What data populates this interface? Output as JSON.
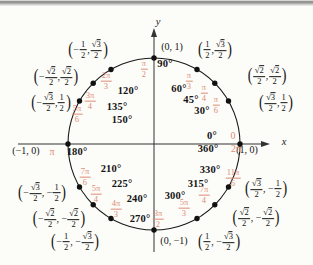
{
  "figure": {
    "type": "unit-circle-diagram",
    "axes": {
      "x_label": "x",
      "y_label": "y"
    },
    "colors": {
      "radian_labels": "#dd8c75",
      "degree_labels": "#141414",
      "coordinate_labels": "#141414",
      "circle": "#1a1a1a",
      "axis": "#333333",
      "top_rule": "#8d8d8b"
    }
  },
  "points": [
    {
      "id": "0",
      "angle_deg": 0,
      "degree_label": "0°",
      "radian": [
        {
          "t": "txt",
          "v": "0"
        }
      ],
      "coordinate": [
        {
          "t": "txt",
          "v": "(1, 0)"
        }
      ]
    },
    {
      "id": "30",
      "angle_deg": 30,
      "degree_label": "30°",
      "radian": [
        {
          "t": "frac",
          "num": "π",
          "den": "6"
        }
      ],
      "coordinate": [
        {
          "t": "par",
          "v": "("
        },
        {
          "t": "frac",
          "num": "√3",
          "den": "2"
        },
        {
          "t": "txt",
          "v": ", "
        },
        {
          "t": "frac",
          "num": "1",
          "den": "2"
        },
        {
          "t": "par",
          "v": ")"
        }
      ]
    },
    {
      "id": "45",
      "angle_deg": 45,
      "degree_label": "45°",
      "radian": [
        {
          "t": "frac",
          "num": "π",
          "den": "4"
        }
      ],
      "coordinate": [
        {
          "t": "par",
          "v": "("
        },
        {
          "t": "frac",
          "num": "√2",
          "den": "2"
        },
        {
          "t": "txt",
          "v": ", "
        },
        {
          "t": "frac",
          "num": "√2",
          "den": "2"
        },
        {
          "t": "par",
          "v": ")"
        }
      ]
    },
    {
      "id": "60",
      "angle_deg": 60,
      "degree_label": "60°",
      "radian": [
        {
          "t": "frac",
          "num": "π",
          "den": "3"
        }
      ],
      "coordinate": [
        {
          "t": "par",
          "v": "("
        },
        {
          "t": "frac",
          "num": "1",
          "den": "2"
        },
        {
          "t": "txt",
          "v": ", "
        },
        {
          "t": "frac",
          "num": "√3",
          "den": "2"
        },
        {
          "t": "par",
          "v": ")"
        }
      ]
    },
    {
      "id": "90",
      "angle_deg": 90,
      "degree_label": "90°",
      "radian": [
        {
          "t": "frac",
          "num": "π",
          "den": "2"
        }
      ],
      "coordinate": [
        {
          "t": "txt",
          "v": "(0, 1)"
        }
      ]
    },
    {
      "id": "120",
      "angle_deg": 120,
      "degree_label": "120°",
      "radian": [
        {
          "t": "frac",
          "num": "2π",
          "den": "3"
        }
      ],
      "coordinate": [
        {
          "t": "par",
          "v": "("
        },
        {
          "t": "txt",
          "v": "−"
        },
        {
          "t": "frac",
          "num": "1",
          "den": "2"
        },
        {
          "t": "txt",
          "v": ", "
        },
        {
          "t": "frac",
          "num": "√3",
          "den": "2"
        },
        {
          "t": "par",
          "v": ")"
        }
      ]
    },
    {
      "id": "135",
      "angle_deg": 135,
      "degree_label": "135°",
      "radian": [
        {
          "t": "frac",
          "num": "3π",
          "den": "4"
        }
      ],
      "coordinate": [
        {
          "t": "par",
          "v": "("
        },
        {
          "t": "txt",
          "v": "−"
        },
        {
          "t": "frac",
          "num": "√2",
          "den": "2"
        },
        {
          "t": "txt",
          "v": ", "
        },
        {
          "t": "frac",
          "num": "√2",
          "den": "2"
        },
        {
          "t": "par",
          "v": ")"
        }
      ]
    },
    {
      "id": "150",
      "angle_deg": 150,
      "degree_label": "150°",
      "radian": [
        {
          "t": "frac",
          "num": "5π",
          "den": "6"
        }
      ],
      "coordinate": [
        {
          "t": "par",
          "v": "("
        },
        {
          "t": "txt",
          "v": "−"
        },
        {
          "t": "frac",
          "num": "√3",
          "den": "2"
        },
        {
          "t": "txt",
          "v": ", "
        },
        {
          "t": "frac",
          "num": "1",
          "den": "2"
        },
        {
          "t": "par",
          "v": ")"
        }
      ]
    },
    {
      "id": "180",
      "angle_deg": 180,
      "degree_label": "180°",
      "radian": [
        {
          "t": "txt",
          "v": "π"
        }
      ],
      "coordinate": [
        {
          "t": "txt",
          "v": "(−1, 0)"
        }
      ]
    },
    {
      "id": "210",
      "angle_deg": 210,
      "degree_label": "210°",
      "radian": [
        {
          "t": "frac",
          "num": "7π",
          "den": "6"
        }
      ],
      "coordinate": [
        {
          "t": "par",
          "v": "("
        },
        {
          "t": "txt",
          "v": "−"
        },
        {
          "t": "frac",
          "num": "√3",
          "den": "2"
        },
        {
          "t": "txt",
          "v": ", −"
        },
        {
          "t": "frac",
          "num": "1",
          "den": "2"
        },
        {
          "t": "par",
          "v": ")"
        }
      ]
    },
    {
      "id": "225",
      "angle_deg": 225,
      "degree_label": "225°",
      "radian": [
        {
          "t": "frac",
          "num": "5π",
          "den": "4"
        }
      ],
      "coordinate": [
        {
          "t": "par",
          "v": "("
        },
        {
          "t": "txt",
          "v": "−"
        },
        {
          "t": "frac",
          "num": "√2",
          "den": "2"
        },
        {
          "t": "txt",
          "v": ", −"
        },
        {
          "t": "frac",
          "num": "√2",
          "den": "2"
        },
        {
          "t": "par",
          "v": ")"
        }
      ]
    },
    {
      "id": "240",
      "angle_deg": 240,
      "degree_label": "240°",
      "radian": [
        {
          "t": "frac",
          "num": "4π",
          "den": "3"
        }
      ],
      "coordinate": [
        {
          "t": "par",
          "v": "("
        },
        {
          "t": "txt",
          "v": "−"
        },
        {
          "t": "frac",
          "num": "1",
          "den": "2"
        },
        {
          "t": "txt",
          "v": ", −"
        },
        {
          "t": "frac",
          "num": "√3",
          "den": "2"
        },
        {
          "t": "par",
          "v": ")"
        }
      ]
    },
    {
      "id": "270",
      "angle_deg": 270,
      "degree_label": "270°",
      "radian": [
        {
          "t": "frac",
          "num": "3π",
          "den": "2"
        }
      ],
      "coordinate": [
        {
          "t": "txt",
          "v": "(0, −1)"
        }
      ]
    },
    {
      "id": "300",
      "angle_deg": 300,
      "degree_label": "300°",
      "radian": [
        {
          "t": "frac",
          "num": "5π",
          "den": "3"
        }
      ],
      "coordinate": [
        {
          "t": "par",
          "v": "("
        },
        {
          "t": "frac",
          "num": "1",
          "den": "2"
        },
        {
          "t": "txt",
          "v": ", −"
        },
        {
          "t": "frac",
          "num": "√3",
          "den": "2"
        },
        {
          "t": "par",
          "v": ")"
        }
      ]
    },
    {
      "id": "315",
      "angle_deg": 315,
      "degree_label": "315°",
      "radian": [
        {
          "t": "frac",
          "num": "7π",
          "den": "4"
        }
      ],
      "coordinate": [
        {
          "t": "par",
          "v": "("
        },
        {
          "t": "frac",
          "num": "√2",
          "den": "2"
        },
        {
          "t": "txt",
          "v": ", −"
        },
        {
          "t": "frac",
          "num": "√2",
          "den": "2"
        },
        {
          "t": "par",
          "v": ")"
        }
      ]
    },
    {
      "id": "330",
      "angle_deg": 330,
      "degree_label": "330°",
      "radian": [
        {
          "t": "frac",
          "num": "11π",
          "den": "6"
        }
      ],
      "coordinate": [
        {
          "t": "par",
          "v": "("
        },
        {
          "t": "frac",
          "num": "√3",
          "den": "2"
        },
        {
          "t": "txt",
          "v": ", −"
        },
        {
          "t": "frac",
          "num": "1",
          "den": "2"
        },
        {
          "t": "par",
          "v": ")"
        }
      ]
    },
    {
      "id": "360",
      "angle_deg": 360,
      "degree_label": "360°",
      "radian": [
        {
          "t": "txt",
          "v": "2π"
        }
      ],
      "coordinate": null
    }
  ]
}
